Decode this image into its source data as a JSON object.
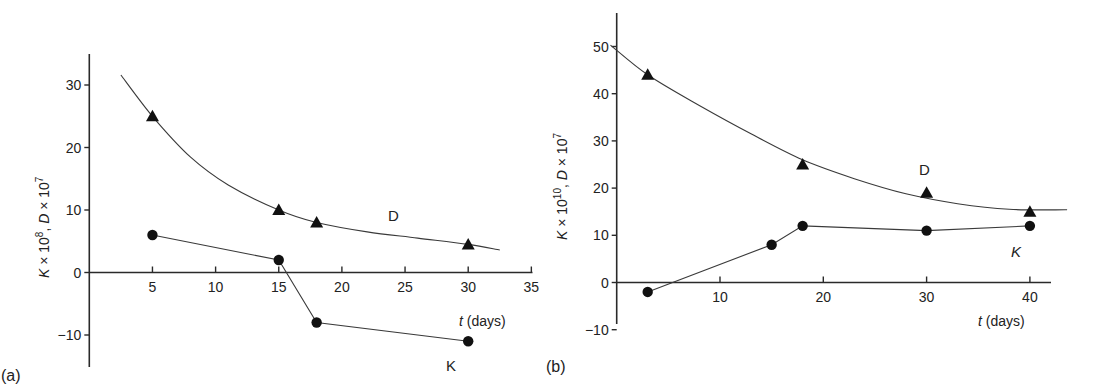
{
  "chart_data": [
    {
      "panel": "(a)",
      "type": "scatter",
      "title": "",
      "xlabel": "t (days)",
      "ylabel": "K × 10⁸, D × 10⁷",
      "xlim": [
        0,
        35
      ],
      "ylim": [
        -13,
        35
      ],
      "xticks": [
        5,
        10,
        15,
        20,
        25,
        30,
        35
      ],
      "yticks": [
        -10,
        0,
        10,
        20,
        30
      ],
      "grid": false,
      "legend": "inline labels",
      "series": [
        {
          "name": "D",
          "marker": "triangle",
          "line": "smooth fitted curve",
          "x": [
            5,
            15,
            18,
            30
          ],
          "values": [
            25,
            10,
            8,
            4.5
          ],
          "curve": [
            [
              2.5,
              31.6
            ],
            [
              5,
              25
            ],
            [
              8,
              18.5
            ],
            [
              11,
              14
            ],
            [
              15,
              10
            ],
            [
              18,
              8
            ],
            [
              22,
              6.5
            ],
            [
              26,
              5.5
            ],
            [
              30,
              4.5
            ],
            [
              32.5,
              3.6
            ]
          ]
        },
        {
          "name": "K",
          "marker": "circle",
          "line": "straight segments",
          "x": [
            5,
            15,
            18,
            30
          ],
          "values": [
            6,
            2,
            -8,
            -11
          ]
        }
      ],
      "annotations": [
        {
          "text": "D",
          "x": 24,
          "y": 9
        },
        {
          "text": "K",
          "x": 28.5,
          "y": -14.5
        }
      ]
    },
    {
      "panel": "(b)",
      "type": "scatter",
      "title": "",
      "xlabel": "t (days)",
      "ylabel": "K × 10¹⁰, D × 10⁷",
      "xlim": [
        0,
        42
      ],
      "ylim": [
        -10,
        57
      ],
      "xticks": [
        10,
        20,
        30,
        40
      ],
      "yticks": [
        -10,
        0,
        10,
        20,
        30,
        40,
        50
      ],
      "grid": false,
      "legend": "inline labels",
      "series": [
        {
          "name": "D",
          "marker": "triangle",
          "line": "smooth fitted curve",
          "x": [
            3,
            18,
            30,
            40
          ],
          "values": [
            44,
            25,
            19,
            15
          ],
          "curve": [
            [
              -0.6,
              50.3
            ],
            [
              3,
              44
            ],
            [
              8,
              37.5
            ],
            [
              13,
              31.5
            ],
            [
              18,
              26
            ],
            [
              23,
              22
            ],
            [
              28,
              18.8
            ],
            [
              33,
              16.7
            ],
            [
              38,
              15.5
            ],
            [
              43.6,
              15.4
            ]
          ]
        },
        {
          "name": "K",
          "marker": "circle",
          "line": "straight segments",
          "x": [
            3,
            15,
            18,
            30,
            40
          ],
          "values": [
            -2,
            8,
            12,
            11,
            12
          ]
        }
      ],
      "annotations": [
        {
          "text": "D",
          "x": 30.5,
          "y": 24
        },
        {
          "text": "K",
          "x": 38.5,
          "y": 6.5
        }
      ]
    }
  ],
  "panels": {
    "a": {
      "label": "(a)",
      "xlabel_italic": "t",
      "xlabel_rest": " (days)",
      "ylabel_k": "K",
      "ylabel_kexp": "8",
      "ylabel_d": "D",
      "ylabel_dexp": "7",
      "series_label_d": "D",
      "series_label_k": "K"
    },
    "b": {
      "label": "(b)",
      "xlabel_italic": "t",
      "xlabel_rest": " (days)",
      "ylabel_k": "K",
      "ylabel_kexp": "10",
      "ylabel_d": "D",
      "ylabel_dexp": "7",
      "series_label_d": "D",
      "series_label_k": "K"
    }
  }
}
